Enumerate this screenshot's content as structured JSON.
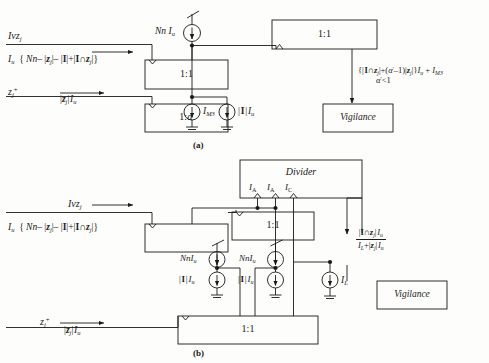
{
  "figure": {
    "panels": [
      {
        "id": "a",
        "caption": "(a)",
        "blocks": [
          {
            "name": "mirror-1to1-upper",
            "label": "1:1"
          },
          {
            "name": "mirror-1toalpha",
            "label": "1:α'"
          },
          {
            "name": "mirror-1to1-top-right",
            "label": "1:1"
          },
          {
            "name": "vigilance",
            "label": "Vigilance"
          }
        ],
        "sources": [
          {
            "name": "source-nn-iu",
            "label": "Nn I",
            "label_sub": "u",
            "adjustable": true
          },
          {
            "name": "source-im3",
            "label": "I",
            "label_sub": "M3",
            "adjustable": false
          },
          {
            "name": "source-i-iu",
            "label": "| I | I",
            "label_sub": "u",
            "adjustable": false
          }
        ],
        "signals": {
          "input_top_name": "Ivz",
          "input_top_sub": "j",
          "input_top_expr": "I_u {Nn - |z_j| - |I| + |I ∩ z_j|}",
          "input_bottom_name": "z",
          "input_bottom_sub": "j",
          "input_bottom_sup": "+",
          "input_bottom_expr": "|z_j| I_u",
          "vigilance_expr_line1": "{| I ∩ z_j | + (α'−1)|z_j|} I_u + I_M3",
          "vigilance_expr_line2": "α' < 1"
        }
      },
      {
        "id": "b",
        "caption": "(b)",
        "blocks": [
          {
            "name": "divider",
            "label": "Divider"
          },
          {
            "name": "mirror-1to1-middle",
            "label": "1:1"
          },
          {
            "name": "mirror-1to1-bottom",
            "label": "1:1"
          },
          {
            "name": "vigilance",
            "label": "Vigilance"
          }
        ],
        "divider_terminals": [
          {
            "name": "terminal-ia-1",
            "label": "I",
            "label_sub": "A"
          },
          {
            "name": "terminal-ia-2",
            "label": "I",
            "label_sub": "A"
          },
          {
            "name": "terminal-ic",
            "label": "I",
            "label_sub": "C"
          }
        ],
        "sources": [
          {
            "name": "source-nn-iu-left",
            "label": "Nn I",
            "label_sub": "u",
            "adjustable": true
          },
          {
            "name": "source-nn-iu-right",
            "label": "Nn I",
            "label_sub": "u",
            "adjustable": true
          },
          {
            "name": "source-i-iu-left",
            "label": "| I | I",
            "label_sub": "u",
            "adjustable": false
          },
          {
            "name": "source-i-iu-right",
            "label": "| I | I",
            "label_sub": "u",
            "adjustable": false
          },
          {
            "name": "source-il",
            "label": "I",
            "label_sub": "L",
            "adjustable": false
          }
        ],
        "signals": {
          "input_top_name": "Ivz",
          "input_top_sub": "j",
          "input_top_expr": "I_u {Nn - |z_j| - |I| + |I ∩ z_j|}",
          "input_bottom_name": "z",
          "input_bottom_sub": "j",
          "input_bottom_sup": "+",
          "input_bottom_expr": "|z_j| I_u",
          "vigilance_numerator": "|I ∩ z_j| I_u",
          "vigilance_denominator": "I_L + |z_j| I_u"
        }
      }
    ],
    "colors": {
      "line": "#1a1a1a",
      "background": "#fdfdfb",
      "text": "#111111"
    }
  }
}
